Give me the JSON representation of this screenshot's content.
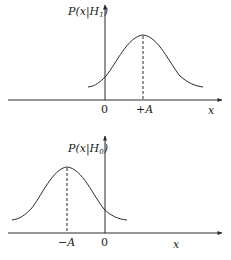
{
  "colors": {
    "stroke": "#2a2a2a",
    "background": "#ffffff"
  },
  "top_plot": {
    "y_label": "P(x|H₁)",
    "y_label_main": "P(x|H",
    "y_label_sub": "1",
    "y_label_close": ")",
    "origin_label": "0",
    "peak_label": "+A",
    "x_label": "x",
    "mean": "+A"
  },
  "bottom_plot": {
    "y_label": "P(x|H₀)",
    "y_label_main": "P(x|H",
    "y_label_sub": "0",
    "y_label_close": ")",
    "origin_label": "0",
    "peak_label": "−A",
    "x_label": "x",
    "mean": "−A"
  }
}
